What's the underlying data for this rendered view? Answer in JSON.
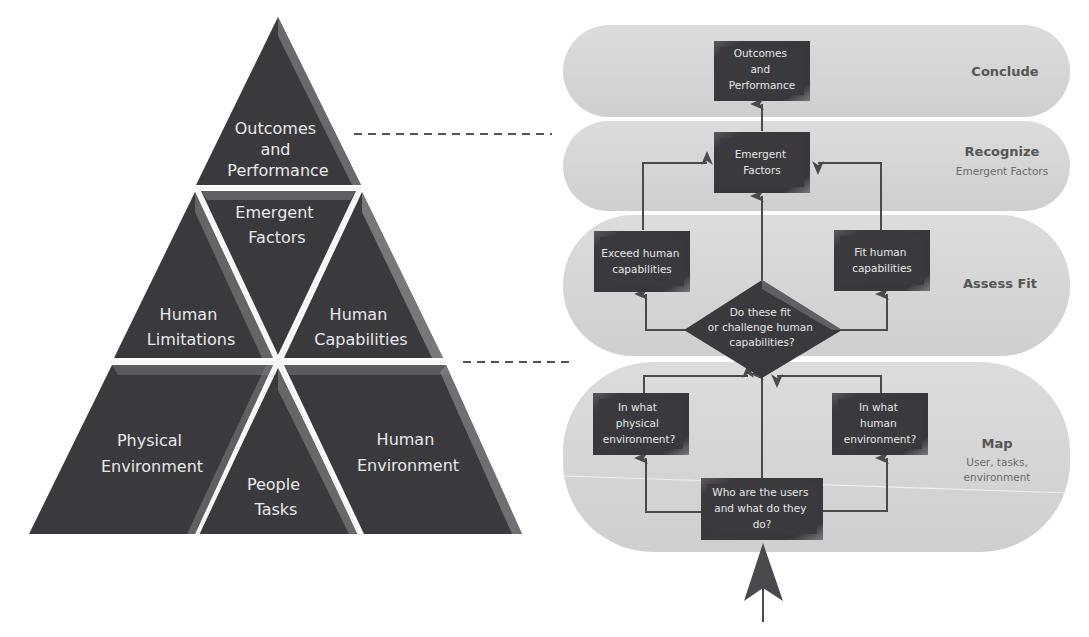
{
  "pyramid": {
    "top": {
      "lines": [
        "Outcomes",
        "and",
        "Performance"
      ]
    },
    "middle_center": {
      "lines": [
        "Emergent",
        "Factors"
      ]
    },
    "middle_left": {
      "lines": [
        "Human",
        "Limitations"
      ]
    },
    "middle_right": {
      "lines": [
        "Human",
        "Capabilities"
      ]
    },
    "bottom_left": {
      "lines": [
        "Physical",
        "Environment"
      ]
    },
    "bottom_center": {
      "lines": [
        "People",
        "Tasks"
      ]
    },
    "bottom_right": {
      "lines": [
        "Human",
        "Environment"
      ]
    }
  },
  "lanes": [
    {
      "id": "conclude",
      "title": "Conclude",
      "subtitle": []
    },
    {
      "id": "recognize",
      "title": "Recognize",
      "subtitle": [
        "Emergent Factors"
      ]
    },
    {
      "id": "assess",
      "title": "Assess Fit",
      "subtitle": []
    },
    {
      "id": "map",
      "title": "Map",
      "subtitle": [
        "User, tasks,",
        "environment"
      ]
    }
  ],
  "flow": {
    "outcomes": {
      "lines": [
        "Outcomes",
        "and",
        "Performance"
      ]
    },
    "emergent": {
      "lines": [
        "Emergent",
        "Factors"
      ]
    },
    "exceed": {
      "lines": [
        "Exceed human",
        "capabilities"
      ]
    },
    "fit": {
      "lines": [
        "Fit human",
        "capabilities"
      ]
    },
    "decision": {
      "lines": [
        "Do these fit",
        "or challenge human",
        "capabilities?"
      ]
    },
    "physical": {
      "lines": [
        "In what",
        "physical",
        "environment?"
      ]
    },
    "human": {
      "lines": [
        "In what",
        "human",
        "environment?"
      ]
    },
    "users": {
      "lines": [
        "Who are the users",
        "and what do they",
        "do?"
      ]
    }
  },
  "colors": {
    "dark_fill": "#3a3a3e",
    "lane_fill": "#d6d6d6",
    "line": "#4a4a4e",
    "dash": "#555555"
  }
}
